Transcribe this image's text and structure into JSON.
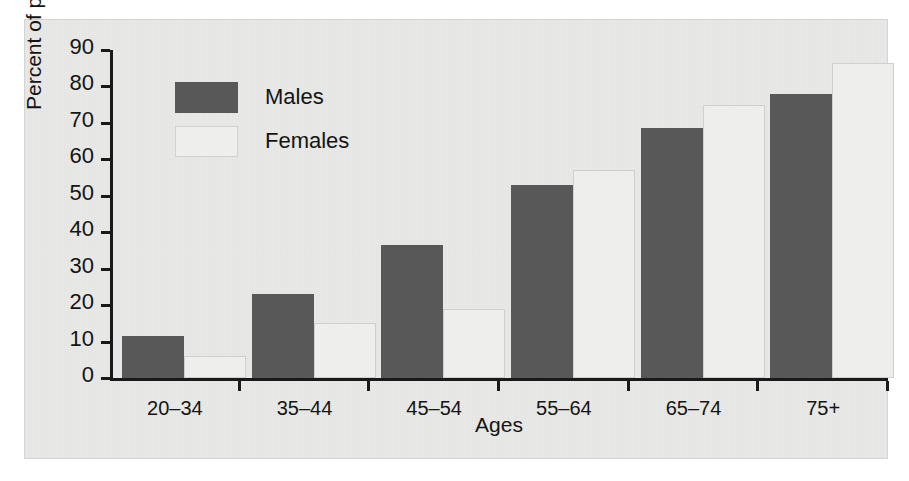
{
  "chart_data": {
    "type": "bar",
    "title": "",
    "xlabel": "Ages",
    "ylabel": "Percent of population",
    "categories": [
      "20–34",
      "35–44",
      "45–54",
      "55–64",
      "65–74",
      "75+"
    ],
    "series": [
      {
        "name": "Males",
        "color": "#585858",
        "values": [
          11.5,
          23,
          36.5,
          53,
          68.5,
          78
        ]
      },
      {
        "name": "Females",
        "color": "#eeeeec",
        "values": [
          6,
          15,
          19,
          57,
          75,
          86.5
        ]
      }
    ],
    "ylim": [
      0,
      90
    ],
    "yticks": [
      0,
      10,
      20,
      30,
      40,
      50,
      60,
      70,
      80,
      90
    ],
    "ytick_labels": [
      "0",
      "10",
      "20",
      "30",
      "40",
      "50",
      "60",
      "70",
      "80",
      "90"
    ],
    "grid": false,
    "legend_position": "upper-left-inside",
    "legend": [
      "Males",
      "Females"
    ]
  },
  "legend": {
    "males_label": "Males",
    "females_label": "Females"
  },
  "axes": {
    "x_title": "Ages",
    "y_title": "Percent of population"
  },
  "colors": {
    "males": "#585858",
    "females": "#eeeeec",
    "panel_background": "#e9e9e7",
    "axis": "#1a1a1a",
    "text": "#141414"
  }
}
